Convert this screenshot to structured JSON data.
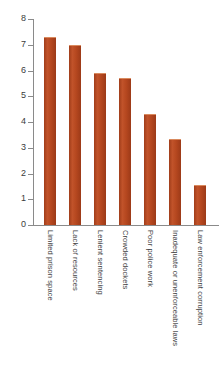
{
  "chart_data": {
    "type": "bar",
    "title": "",
    "subtitle": "",
    "xlabel": "",
    "ylabel": "",
    "ylim": [
      0,
      8
    ],
    "yticks": [
      0,
      1,
      2,
      3,
      4,
      5,
      6,
      7,
      8
    ],
    "ytick_labels": [
      "0",
      "1",
      "2",
      "3",
      "4",
      "5",
      "6",
      "7",
      "8"
    ],
    "grid": false,
    "legend": false,
    "bar_color": "#b5471f",
    "axis_color": "#8a8a8a",
    "text_color": "#3b3b3b",
    "categories": [
      "Limited prison space",
      "Lack of resources",
      "Lenient sentencing",
      "Crowded dockets",
      "Poor police work",
      "Inadequate or unenforceable laws",
      "Law enforcement corruption"
    ],
    "values": [
      7.3,
      7.0,
      5.9,
      5.7,
      4.3,
      3.35,
      1.55
    ]
  }
}
